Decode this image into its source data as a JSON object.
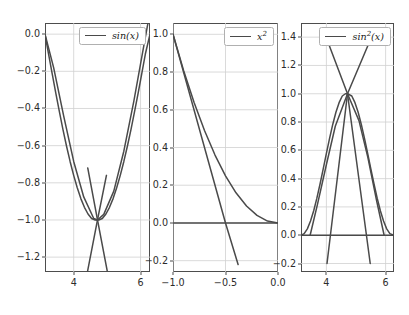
{
  "figure": {
    "width": 409,
    "height": 315,
    "background": "#ffffff",
    "line_color": "#4a4a4a",
    "grid_color": "#d0d0d0",
    "axis_color": "#4d4d4d"
  },
  "chart_data": [
    {
      "type": "line",
      "index": 0,
      "title": "",
      "xlabel": "",
      "ylabel": "",
      "xlim": [
        3.1416,
        6.2832
      ],
      "ylim": [
        -1.28,
        0.06
      ],
      "xticks": [
        4,
        6
      ],
      "xticklabels": [
        "4",
        "6"
      ],
      "yticks": [
        0.0,
        -0.2,
        -0.4,
        -0.6,
        -0.8,
        -1.0,
        -1.2
      ],
      "yticklabels": [
        "0.0",
        "-0.2",
        "-0.4",
        "-0.6",
        "-0.8",
        "-1.0",
        "-1.2"
      ],
      "grid": true,
      "legend": {
        "position": "upper right",
        "entries": [
          {
            "label": "sin(x)",
            "label_html": "sin(x)",
            "color": "#4a4a4a"
          }
        ]
      },
      "series": [
        {
          "name": "sin(x)",
          "x": [
            3.1416,
            3.2488,
            3.3561,
            3.4633,
            3.5705,
            3.6778,
            3.785,
            3.8922,
            3.9995,
            4.1067,
            4.2139,
            4.3212,
            4.4284,
            4.5356,
            4.6429,
            4.7501,
            4.8573,
            4.9646,
            5.0718,
            5.179,
            5.2863,
            5.3935,
            5.5007,
            5.608,
            5.7152,
            5.8224,
            5.9297,
            6.0369,
            6.1441,
            6.2832
          ],
          "y": [
            0.0,
            -0.107,
            -0.213,
            -0.316,
            -0.416,
            -0.512,
            -0.602,
            -0.685,
            -0.76,
            -0.827,
            -0.885,
            -0.932,
            -0.968,
            -0.992,
            -1.0,
            -1.0,
            -0.992,
            -0.968,
            -0.932,
            -0.885,
            -0.827,
            -0.76,
            -0.685,
            -0.602,
            -0.512,
            -0.416,
            -0.316,
            -0.213,
            -0.107,
            0.0
          ]
        },
        {
          "name": "quadratic-approximation",
          "x": [
            3.1416,
            3.4,
            3.7,
            4.0,
            4.3,
            4.6,
            4.7124,
            4.9,
            5.2,
            5.5,
            5.8,
            6.1,
            6.2832
          ],
          "y": [
            0.0,
            -0.18,
            -0.44,
            -0.685,
            -0.876,
            -0.992,
            -1.0,
            -0.97,
            -0.845,
            -0.63,
            -0.36,
            -0.06,
            0.12
          ]
        },
        {
          "name": "tangent-line",
          "x": [
            4.42,
            4.7124,
            5.02
          ],
          "y": [
            -0.72,
            -1.0,
            -1.29
          ]
        },
        {
          "name": "tangent-line-mirror",
          "x": [
            4.4,
            4.7124,
            4.98
          ],
          "y": [
            -1.29,
            -1.0,
            -0.76
          ]
        }
      ]
    },
    {
      "type": "line",
      "index": 1,
      "title": "",
      "xlabel": "",
      "ylabel": "",
      "xlim": [
        -1.0,
        0.0
      ],
      "ylim": [
        -0.26,
        1.06
      ],
      "xticks": [
        -1.0,
        -0.5,
        0.0
      ],
      "xticklabels": [
        "-1.0",
        "-0.5",
        "0.0"
      ],
      "yticks": [
        1.0,
        0.8,
        0.6,
        0.4,
        0.2,
        0.0,
        -0.2
      ],
      "yticklabels": [
        "1.0",
        "0.8",
        "0.6",
        "0.4",
        "0.2",
        "0.0",
        "-0.2"
      ],
      "grid": true,
      "legend": {
        "position": "upper right",
        "entries": [
          {
            "label": "x^2",
            "label_html": "x<sup>2</sup>",
            "color": "#4a4a4a"
          }
        ]
      },
      "series": [
        {
          "name": "x^2",
          "x": [
            -1.0,
            -0.9,
            -0.8,
            -0.7,
            -0.6,
            -0.5,
            -0.4,
            -0.3,
            -0.2,
            -0.1,
            0.0
          ],
          "y": [
            1.0,
            0.81,
            0.64,
            0.49,
            0.36,
            0.25,
            0.16,
            0.09,
            0.04,
            0.01,
            0.0
          ]
        },
        {
          "name": "secant-line",
          "x": [
            -1.0,
            -0.5,
            -0.38
          ],
          "y": [
            1.0,
            0.0,
            -0.22
          ]
        },
        {
          "name": "zero-line",
          "x": [
            -1.0,
            0.0
          ],
          "y": [
            0.0,
            0.0
          ]
        }
      ]
    },
    {
      "type": "line",
      "index": 2,
      "title": "",
      "xlabel": "",
      "ylabel": "",
      "xlim": [
        3.1416,
        6.2832
      ],
      "ylim": [
        -0.26,
        1.5
      ],
      "xticks": [
        4,
        6
      ],
      "xticklabels": [
        "4",
        "6"
      ],
      "yticks": [
        1.4,
        1.2,
        1.0,
        0.8,
        0.6,
        0.4,
        0.2,
        0.0,
        -0.2
      ],
      "yticklabels": [
        "1.4",
        "1.2",
        "1.0",
        "0.8",
        "0.6",
        "0.4",
        "0.2",
        "0.0",
        "-0.2"
      ],
      "grid": true,
      "legend": {
        "position": "upper right",
        "entries": [
          {
            "label": "sin^2(x)",
            "label_html": "sin<sup>2</sup>(x)",
            "color": "#4a4a4a"
          }
        ]
      },
      "series": [
        {
          "name": "sin^2(x)",
          "x": [
            3.1416,
            3.2488,
            3.3561,
            3.4633,
            3.5705,
            3.6778,
            3.785,
            3.8922,
            3.9995,
            4.1067,
            4.2139,
            4.3212,
            4.4284,
            4.5356,
            4.6429,
            4.7124,
            4.8573,
            4.9646,
            5.0718,
            5.179,
            5.2863,
            5.3935,
            5.5007,
            5.608,
            5.7152,
            5.8224,
            5.9297,
            6.0369,
            6.1441,
            6.2832
          ],
          "y": [
            0.0,
            0.011,
            0.045,
            0.1,
            0.173,
            0.262,
            0.362,
            0.469,
            0.578,
            0.684,
            0.783,
            0.869,
            0.937,
            0.984,
            1.0,
            1.0,
            0.984,
            0.937,
            0.869,
            0.783,
            0.684,
            0.578,
            0.469,
            0.362,
            0.262,
            0.173,
            0.1,
            0.045,
            0.011,
            0.0
          ]
        },
        {
          "name": "parabola-approximation",
          "x": [
            3.45,
            3.7,
            4.0,
            4.3,
            4.7124,
            5.1,
            5.4,
            5.7,
            5.95
          ],
          "y": [
            0.0,
            0.22,
            0.5,
            0.77,
            1.0,
            0.81,
            0.55,
            0.24,
            0.0
          ]
        },
        {
          "name": "tangent-line-left",
          "x": [
            4.02,
            4.7124,
            5.42
          ],
          "y": [
            -0.2,
            1.0,
            1.35
          ]
        },
        {
          "name": "tangent-line-right",
          "x": [
            4.08,
            4.7124,
            5.48
          ],
          "y": [
            1.35,
            1.0,
            -0.2
          ]
        },
        {
          "name": "zero-line",
          "x": [
            3.1416,
            6.2832
          ],
          "y": [
            0.0,
            0.0
          ]
        }
      ]
    }
  ]
}
